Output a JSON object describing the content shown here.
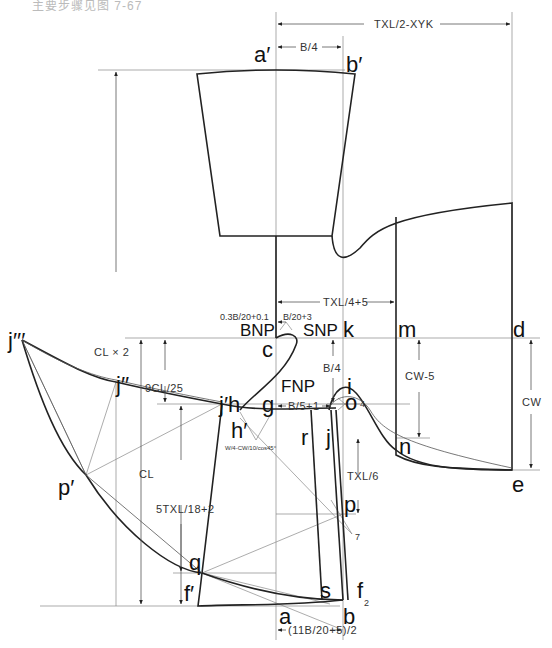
{
  "caption": "主要步骤见图 7-67",
  "points": {
    "a_prime": "a′",
    "b_prime": "b′",
    "c": "c",
    "k": "k",
    "m": "m",
    "d": "d",
    "i": "i",
    "o": "o",
    "n": "n",
    "e": "e",
    "j3": "j′′′",
    "j2": "j′′",
    "j1h": "j′h",
    "h_prime": "h′",
    "g": "g",
    "r": "r",
    "j": "j",
    "p": "p",
    "p_prime": "p′",
    "q": "q",
    "f_prime": "f′",
    "s": "s",
    "f": "f",
    "a": "a",
    "b": "b"
  },
  "neck_points": {
    "bnp": "BNP",
    "snp": "SNP",
    "fnp": "FNP"
  },
  "dimensions": {
    "txl_half_minus_xyk": "TXL/2-XYK",
    "b_over_4_top": "B/4",
    "txl_quarter_plus_5": "TXL/4+5",
    "back_neck_rise": "0.3B/20+0.1",
    "neck_width": "B/20+3",
    "b_over_4_side": "B/4",
    "b5_plus_1": "B/5+1",
    "cw_minus_5": "CW-5",
    "cw": "CW",
    "txl_over_6": "TXL/6",
    "cl_times_2": "CL × 2",
    "nine_cl_25": "9CL/25",
    "cl": "CL",
    "five_txl_18": "5TXL/18+2",
    "hem_width": "(11B/20+5)/2",
    "gusset_formula": "W/4-CW/10/cos45°",
    "mark_4": "4",
    "mark_7": "7",
    "mark_2": "2"
  }
}
